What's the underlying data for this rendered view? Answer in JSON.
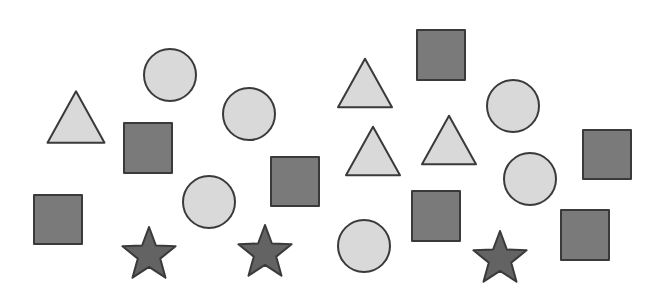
{
  "scene": {
    "background": "#ffffff",
    "colors": {
      "light_fill": "#d9d9d9",
      "dark_fill": "#7a7a7a",
      "star_fill": "#636363",
      "stroke": "#3a3a3a"
    },
    "counts": {
      "triangles": 4,
      "circles": 6,
      "squares": 7,
      "stars": 3,
      "total": 20
    },
    "shapes": [
      {
        "type": "triangle",
        "fill": "light",
        "cx": 76,
        "cy": 117,
        "size": 57
      },
      {
        "type": "circle",
        "fill": "light",
        "cx": 170,
        "cy": 75,
        "r": 26
      },
      {
        "type": "square",
        "fill": "dark",
        "x": 124,
        "y": 123,
        "w": 48,
        "h": 50
      },
      {
        "type": "circle",
        "fill": "light",
        "cx": 249,
        "cy": 114,
        "r": 26
      },
      {
        "type": "triangle",
        "fill": "light",
        "cx": 365,
        "cy": 83,
        "size": 54
      },
      {
        "type": "square",
        "fill": "dark",
        "x": 417,
        "y": 30,
        "w": 48,
        "h": 50
      },
      {
        "type": "circle",
        "fill": "light",
        "cx": 513,
        "cy": 106,
        "r": 26
      },
      {
        "type": "triangle",
        "fill": "light",
        "cx": 373,
        "cy": 151,
        "size": 54
      },
      {
        "type": "triangle",
        "fill": "light",
        "cx": 449,
        "cy": 140,
        "size": 54
      },
      {
        "type": "circle",
        "fill": "light",
        "cx": 530,
        "cy": 179,
        "r": 26
      },
      {
        "type": "square",
        "fill": "dark",
        "x": 583,
        "y": 130,
        "w": 48,
        "h": 49
      },
      {
        "type": "square",
        "fill": "dark",
        "x": 34,
        "y": 195,
        "w": 48,
        "h": 49
      },
      {
        "type": "circle",
        "fill": "light",
        "cx": 209,
        "cy": 202,
        "r": 26
      },
      {
        "type": "square",
        "fill": "dark",
        "x": 271,
        "y": 157,
        "w": 48,
        "h": 49
      },
      {
        "type": "star",
        "fill": "star",
        "cx": 149,
        "cy": 255,
        "r": 28
      },
      {
        "type": "star",
        "fill": "star",
        "cx": 265,
        "cy": 253,
        "r": 28
      },
      {
        "type": "circle",
        "fill": "light",
        "cx": 364,
        "cy": 246,
        "r": 26
      },
      {
        "type": "square",
        "fill": "dark",
        "x": 412,
        "y": 191,
        "w": 48,
        "h": 50
      },
      {
        "type": "star",
        "fill": "star",
        "cx": 500,
        "cy": 259,
        "r": 28
      },
      {
        "type": "square",
        "fill": "dark",
        "x": 561,
        "y": 210,
        "w": 48,
        "h": 50
      }
    ]
  }
}
